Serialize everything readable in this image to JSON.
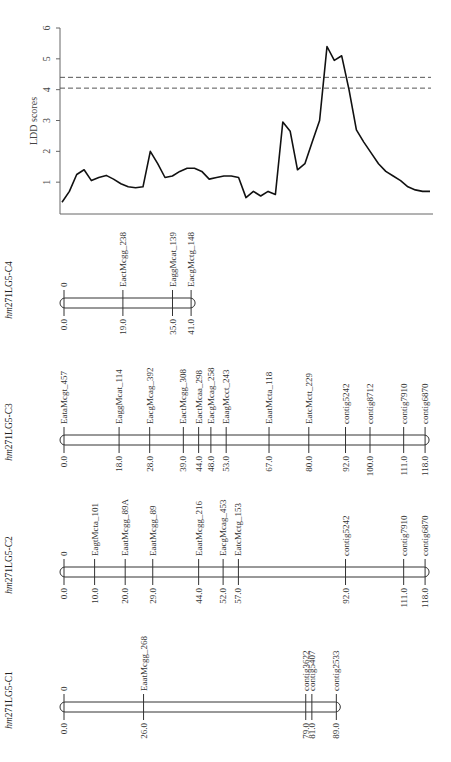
{
  "chart_data": {
    "type": "line",
    "title": "",
    "ylabel": "LDD scores",
    "xlabel": "",
    "ylim": [
      0,
      6
    ],
    "yticks": [
      1,
      2,
      3,
      4,
      5,
      6
    ],
    "thresholds": [
      4.4,
      4.05
    ],
    "x": [
      0,
      2,
      4,
      6,
      8,
      10,
      12,
      14,
      16,
      18,
      20,
      22,
      24,
      26,
      28,
      30,
      32,
      34,
      36,
      38,
      40,
      42,
      44,
      46,
      48,
      50,
      52,
      54,
      56,
      58,
      60,
      62,
      64,
      66,
      68,
      70,
      72,
      74,
      76,
      78,
      80,
      82,
      84,
      86,
      88,
      90,
      92,
      94,
      96,
      98,
      100
    ],
    "values": [
      0.35,
      0.7,
      1.25,
      1.4,
      1.05,
      1.15,
      1.22,
      1.1,
      0.95,
      0.85,
      0.82,
      0.85,
      2.0,
      1.6,
      1.15,
      1.2,
      1.35,
      1.45,
      1.45,
      1.35,
      1.1,
      1.15,
      1.2,
      1.2,
      1.15,
      0.5,
      0.7,
      0.55,
      0.7,
      0.6,
      2.95,
      2.65,
      1.4,
      1.6,
      2.3,
      3.0,
      5.4,
      4.95,
      5.1,
      4.0,
      2.7,
      2.3,
      1.95,
      1.6,
      1.35,
      1.2,
      1.05,
      0.85,
      0.75,
      0.7,
      0.7
    ],
    "grid": false,
    "line_color": "#111111",
    "threshold_color": "#555555"
  },
  "linkage_groups": [
    {
      "id": "C4",
      "title_prefix": "hm",
      "title_suffix": "271LG5-C4",
      "markers": [
        {
          "pos": "0.0",
          "name": "0"
        },
        {
          "pos": "19.0",
          "name": "EactMcgg_238"
        },
        {
          "pos": "35.0",
          "name": "EaggMcat_139"
        },
        {
          "pos": "41.0",
          "name": "EacgMctg_148"
        }
      ]
    },
    {
      "id": "C3",
      "title_prefix": "hm",
      "title_suffix": "271LG5-C3",
      "markers": [
        {
          "pos": "0.0",
          "name": "EataMcgt_457"
        },
        {
          "pos": "18.0",
          "name": "EaggMcat_114"
        },
        {
          "pos": "28.0",
          "name": "EacgMcag_392"
        },
        {
          "pos": "39.0",
          "name": "EactMcgg_308"
        },
        {
          "pos": "44.0",
          "name": "EactMcaa_298"
        },
        {
          "pos": "48.0",
          "name": "EacgMcag_258"
        },
        {
          "pos": "53.0",
          "name": "EaagMcct_243"
        },
        {
          "pos": "67.0",
          "name": "EaatMcta_118"
        },
        {
          "pos": "80.0",
          "name": "EatcMctt_229"
        },
        {
          "pos": "92.0",
          "name": "contig5242"
        },
        {
          "pos": "100.0",
          "name": "contig8712"
        },
        {
          "pos": "111.0",
          "name": "contig7910"
        },
        {
          "pos": "118.0",
          "name": "contig6870"
        }
      ]
    },
    {
      "id": "C2",
      "title_prefix": "hm",
      "title_suffix": "271LG5-C2",
      "markers": [
        {
          "pos": "0.0",
          "name": "0"
        },
        {
          "pos": "10.0",
          "name": "EagtMcta_101"
        },
        {
          "pos": "20.0",
          "name": "EaatMcgg_89A"
        },
        {
          "pos": "29.0",
          "name": "EaatMcgg_89"
        },
        {
          "pos": "44.0",
          "name": "EaatMcgg_216"
        },
        {
          "pos": "52.0",
          "name": "EacgMcag_453"
        },
        {
          "pos": "57.0",
          "name": "EatcMctg_153"
        },
        {
          "pos": "92.0",
          "name": "contig5242"
        },
        {
          "pos": "111.0",
          "name": "contig7910"
        },
        {
          "pos": "118.0",
          "name": "contig6870"
        }
      ]
    },
    {
      "id": "C1",
      "title_prefix": "hm",
      "title_suffix": "271LG5-C1",
      "markers": [
        {
          "pos": "0.0",
          "name": "0"
        },
        {
          "pos": "26.0",
          "name": "EaatMcgg_268"
        },
        {
          "pos": "79.0",
          "name": "contig3622"
        },
        {
          "pos": "81.0",
          "name": "contig5407"
        },
        {
          "pos": "89.0",
          "name": "contig2533"
        }
      ]
    }
  ]
}
